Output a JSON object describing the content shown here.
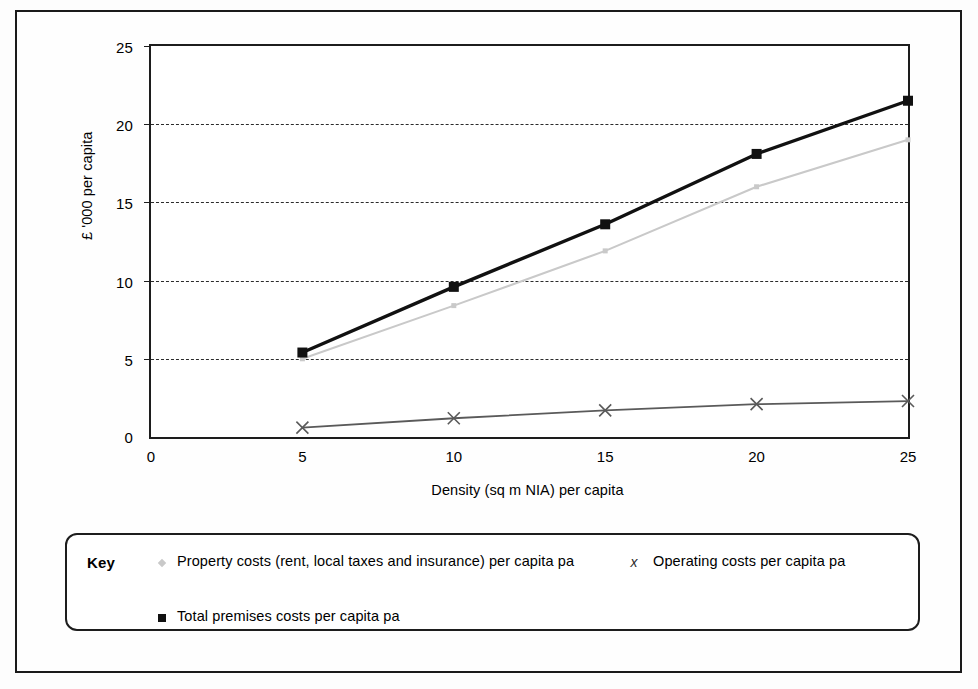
{
  "chart_data": {
    "type": "line",
    "title": "",
    "xlabel": "Density (sq m NIA) per capita",
    "ylabel": "£ '000 per capita",
    "x": [
      5,
      10,
      15,
      20,
      25
    ],
    "xlim": [
      0,
      25
    ],
    "ylim": [
      0,
      25
    ],
    "xticks": [
      "0",
      "5",
      "10",
      "15",
      "20",
      "25"
    ],
    "yticks": [
      "0",
      "5",
      "10",
      "15",
      "20",
      "25"
    ],
    "grid": "horizontal-dashed",
    "legend_position": "below-plot",
    "series": [
      {
        "name": "Property costs (rent, local taxes and insurance) per capita pa",
        "values": [
          5.0,
          8.4,
          11.9,
          16.0,
          19.0
        ],
        "color": "#c9c9c9",
        "marker": "small-diamond"
      },
      {
        "name": "Operating costs per capita pa",
        "values": [
          0.6,
          1.2,
          1.7,
          2.1,
          2.3
        ],
        "color": "#5a5a5a",
        "marker": "x"
      },
      {
        "name": "Total premises costs per capita pa",
        "values": [
          5.4,
          9.6,
          13.6,
          18.1,
          21.5
        ],
        "color": "#111111",
        "marker": "filled-square"
      }
    ]
  },
  "axes": {
    "y_title": "£ '000 per capita",
    "x_title": "Density (sq m NIA) per capita",
    "y_tick_labels": [
      "25",
      "20",
      "15",
      "10",
      "5",
      "0"
    ],
    "x_tick_labels": [
      "0",
      "5",
      "10",
      "15",
      "20",
      "25"
    ]
  },
  "legend": {
    "key_label": "Key",
    "entries": [
      {
        "label": "Property costs (rent, local taxes and insurance) per capita pa",
        "marker": "small-grey-diamond-icon"
      },
      {
        "label": "Operating costs per capita pa",
        "marker": "x-marker-icon"
      },
      {
        "label": "Total premises costs per capita pa",
        "marker": "black-square-icon"
      }
    ]
  },
  "colors": {
    "total_series": "#111111",
    "property_series": "#c9c9c9",
    "operating_series": "#5a5a5a",
    "axis": "#1d1d1d",
    "gridline": "#2b2b2b"
  }
}
